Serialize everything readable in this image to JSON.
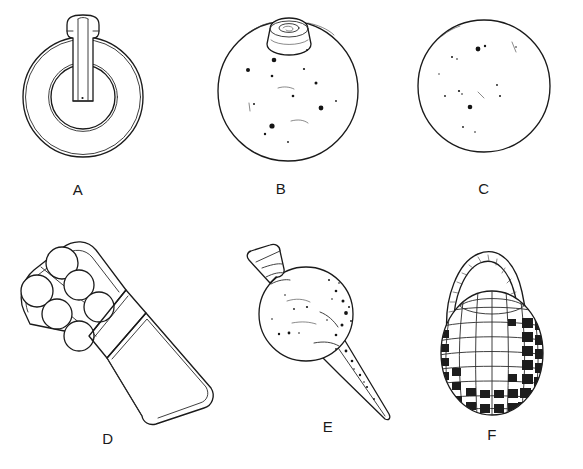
{
  "plate": {
    "type": "archaeological-line-drawing-plate",
    "background_color": "#ffffff",
    "ink_color": "#1a1a1a",
    "width": 583,
    "height": 469,
    "rows": 2,
    "columns": 3
  },
  "figures": [
    {
      "id": "A",
      "label": "A",
      "name": "ring-with-tang",
      "description": "annular ring object with flared handle tang entering from top",
      "row": 1,
      "column": 1,
      "label_x": 68,
      "label_y": 184
    },
    {
      "id": "B",
      "label": "B",
      "name": "spherical-grenade-with-fuse-plug",
      "description": "sphere with truncated conical fuse plug at top, stippled surface",
      "row": 1,
      "column": 2,
      "label_x": 272,
      "label_y": 180
    },
    {
      "id": "C",
      "label": "C",
      "name": "plain-sphere",
      "description": "plain sphere outline with sparse surface speckles",
      "row": 1,
      "column": 3,
      "label_x": 464,
      "label_y": 180
    },
    {
      "id": "D",
      "label": "D",
      "name": "studded-club-head-with-tapering-handle",
      "description": "angled club head set with six spherical studs and a long tapering handle",
      "row": 2,
      "column": 1,
      "label_x": 108,
      "label_y": 438
    },
    {
      "id": "E",
      "label": "E",
      "name": "spherical-flask-with-spike",
      "description": "spherical body with flared neck upper-left and long tapering spike lower-right",
      "row": 2,
      "column": 2,
      "label_x": 328,
      "label_y": 428
    },
    {
      "id": "F",
      "label": "F",
      "name": "segmented-fragmentation-grenade-with-cord",
      "description": "ovoid grenade with grid of raised segments and twisted cord loop",
      "row": 2,
      "column": 3,
      "label_x": 488,
      "label_y": 444
    }
  ]
}
